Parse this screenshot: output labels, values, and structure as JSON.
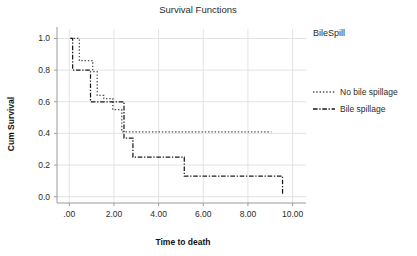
{
  "chart_data": {
    "type": "line",
    "subtype": "kaplan-meier-step",
    "title": "Survival Functions",
    "xlabel": "Time to death",
    "ylabel": "Cum Survival",
    "xlim": [
      -0.55,
      10.6
    ],
    "ylim": [
      -0.04,
      1.06
    ],
    "xticks": [
      0,
      2,
      4,
      6,
      8,
      10
    ],
    "xticklabels": [
      ".00",
      "2.00",
      "4.00",
      "6.00",
      "8.00",
      "10.00"
    ],
    "yticks": [
      0.0,
      0.2,
      0.4,
      0.6,
      0.8,
      1.0
    ],
    "yticklabels": [
      "0.0",
      "0.2",
      "0.4",
      "0.6",
      "0.8",
      "1.0"
    ],
    "grid": "both-light",
    "legend_position": "right-outside",
    "legend_title": "BileSpill",
    "series": [
      {
        "name": "No bile spillage",
        "style": "dotted",
        "color": "#4d4d4d",
        "x": [
          0.05,
          0.45,
          0.45,
          1.05,
          1.05,
          1.25,
          1.25,
          1.55,
          1.55,
          1.95,
          1.95,
          2.35,
          2.35,
          9.05
        ],
        "y": [
          1.0,
          1.0,
          0.86,
          0.86,
          0.79,
          0.79,
          0.64,
          0.64,
          0.62,
          0.62,
          0.55,
          0.55,
          0.41,
          0.41
        ]
      },
      {
        "name": "Bile spillage",
        "style": "dashdot",
        "color": "#1a1a1a",
        "x": [
          0.05,
          0.15,
          0.15,
          0.55,
          0.55,
          0.95,
          0.95,
          1.75,
          1.75,
          2.45,
          2.45,
          2.55,
          2.55,
          2.85,
          2.85,
          5.15,
          5.15,
          9.55,
          9.55
        ],
        "y": [
          1.0,
          1.0,
          0.8,
          0.8,
          0.8,
          0.8,
          0.6,
          0.6,
          0.6,
          0.6,
          0.37,
          0.37,
          0.37,
          0.37,
          0.25,
          0.25,
          0.13,
          0.13,
          0.01
        ]
      }
    ]
  },
  "legend": {
    "title": "BileSpill",
    "items": [
      {
        "label": "No bile spillage",
        "style": "dotted"
      },
      {
        "label": "Bile spillage",
        "style": "dashdot"
      }
    ]
  }
}
